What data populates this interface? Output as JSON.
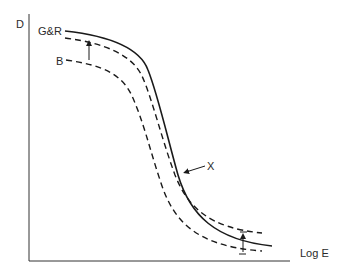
{
  "diagram": {
    "y_axis_label": "D",
    "x_axis_label": "Log E",
    "curves": [
      {
        "name": "G&R",
        "label": "G&R",
        "style": "solid"
      },
      {
        "name": "G&R-shifted",
        "label": "",
        "style": "dashed"
      },
      {
        "name": "B",
        "label": "B",
        "style": "dashed"
      }
    ],
    "crossover_label": "X",
    "colors": {
      "line": "#1a1a1a",
      "background": "#ffffff"
    }
  }
}
